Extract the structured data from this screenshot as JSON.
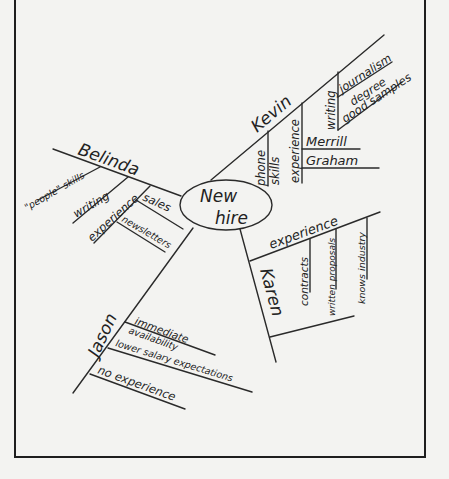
{
  "diagram": {
    "type": "mind-map",
    "center": {
      "line1": "New",
      "line2": "hire"
    },
    "branches": [
      {
        "name": "Kevin",
        "items": [
          {
            "label_line1": "phone",
            "label_line2": "skills"
          },
          {
            "label": "experience",
            "children": [
              "Merrill",
              "Graham"
            ]
          },
          {
            "label": "writing",
            "children": [
              "journalism",
              "degree",
              "good samples"
            ]
          }
        ]
      },
      {
        "name": "Belinda",
        "items": [
          {
            "label": "\"people\" skills"
          },
          {
            "label": "writing"
          },
          {
            "label": "experience",
            "children": [
              "sales",
              "newsletters"
            ]
          }
        ]
      },
      {
        "name": "Karen",
        "items": [
          {
            "label": "experience",
            "children": [
              "contracts",
              "written proposals",
              "knows industry"
            ]
          },
          {
            "label": ""
          }
        ]
      },
      {
        "name": "Jason",
        "items": [
          {
            "label_line1": "immediate",
            "label_line2": "availability"
          },
          {
            "label": "lower salary expectations"
          },
          {
            "label": "no experience"
          }
        ]
      }
    ]
  }
}
